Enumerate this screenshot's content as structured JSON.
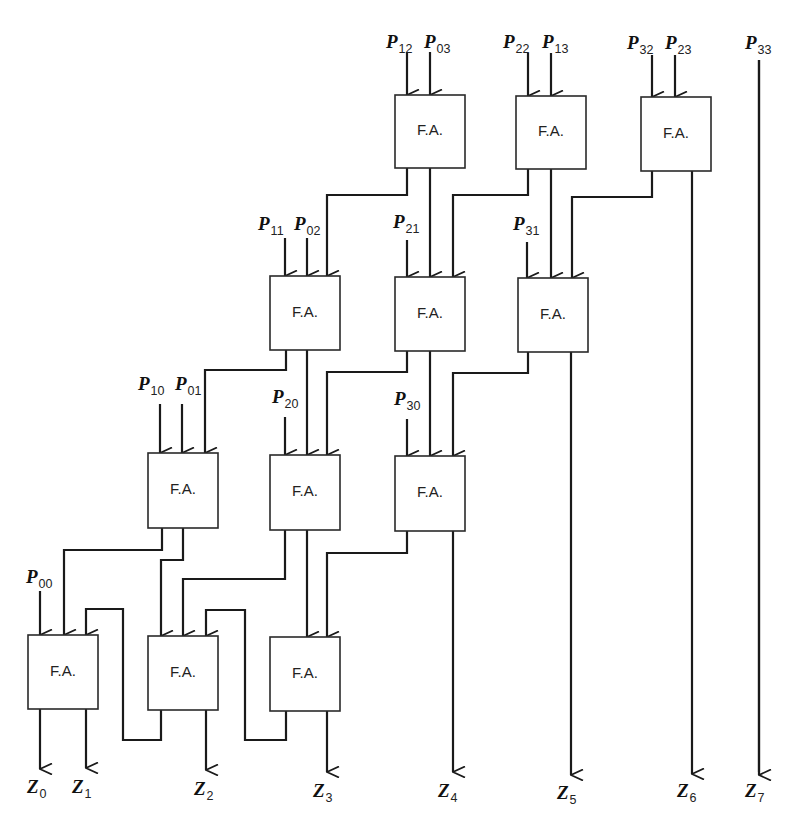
{
  "diagram": {
    "type": "array-multiplier-4x4",
    "cell_label": "F.A.",
    "colors": {
      "line": "#1a1a1a",
      "box_border": "#2a2a2a",
      "background": "#ffffff"
    },
    "cells": [
      {
        "id": "A1",
        "row": 1,
        "x": 395,
        "y": 95,
        "w": 70,
        "h": 73,
        "label": "F.A."
      },
      {
        "id": "A2",
        "row": 1,
        "x": 516,
        "y": 96,
        "w": 70,
        "h": 73,
        "label": "F.A."
      },
      {
        "id": "A3",
        "row": 1,
        "x": 641,
        "y": 97,
        "w": 70,
        "h": 74,
        "label": "F.A."
      },
      {
        "id": "B1",
        "row": 2,
        "x": 270,
        "y": 276,
        "w": 70,
        "h": 74,
        "label": "F.A."
      },
      {
        "id": "B2",
        "row": 2,
        "x": 395,
        "y": 277,
        "w": 70,
        "h": 74,
        "label": "F.A."
      },
      {
        "id": "B3",
        "row": 2,
        "x": 518,
        "y": 278,
        "w": 70,
        "h": 74,
        "label": "F.A."
      },
      {
        "id": "C1",
        "row": 3,
        "x": 148,
        "y": 453,
        "w": 70,
        "h": 75,
        "label": "F.A."
      },
      {
        "id": "C2",
        "row": 3,
        "x": 270,
        "y": 455,
        "w": 70,
        "h": 75,
        "label": "F.A."
      },
      {
        "id": "C3",
        "row": 3,
        "x": 395,
        "y": 456,
        "w": 70,
        "h": 75,
        "label": "F.A."
      },
      {
        "id": "D1",
        "row": 4,
        "x": 28,
        "y": 635,
        "w": 70,
        "h": 74,
        "label": "F.A."
      },
      {
        "id": "D2",
        "row": 4,
        "x": 148,
        "y": 636,
        "w": 70,
        "h": 74,
        "label": "F.A."
      },
      {
        "id": "D3",
        "row": 4,
        "x": 270,
        "y": 637,
        "w": 70,
        "h": 74,
        "label": "F.A."
      }
    ],
    "inputs": [
      {
        "name": "P",
        "sub": "12",
        "label_x": 386,
        "label_y": 48,
        "x": 407,
        "y1": 52,
        "y2": 95
      },
      {
        "name": "P",
        "sub": "03",
        "label_x": 424,
        "label_y": 48,
        "x": 430,
        "y1": 52,
        "y2": 95
      },
      {
        "name": "P",
        "sub": "22",
        "label_x": 503,
        "label_y": 48,
        "x": 528,
        "y1": 53,
        "y2": 96
      },
      {
        "name": "P",
        "sub": "13",
        "label_x": 542,
        "label_y": 48,
        "x": 551,
        "y1": 53,
        "y2": 96
      },
      {
        "name": "P",
        "sub": "32",
        "label_x": 627,
        "label_y": 49,
        "x": 652,
        "y1": 55,
        "y2": 97
      },
      {
        "name": "P",
        "sub": "23",
        "label_x": 665,
        "label_y": 49,
        "x": 675,
        "y1": 55,
        "y2": 97
      },
      {
        "name": "P",
        "sub": "11",
        "label_x": 258,
        "label_y": 230,
        "x": 285,
        "y1": 238,
        "y2": 276
      },
      {
        "name": "P",
        "sub": "02",
        "label_x": 294,
        "label_y": 230,
        "x": 307,
        "y1": 238,
        "y2": 276
      },
      {
        "name": "P",
        "sub": "21",
        "label_x": 393,
        "label_y": 228,
        "x": 407,
        "y1": 240,
        "y2": 277
      },
      {
        "name": "P",
        "sub": "31",
        "label_x": 513,
        "label_y": 230,
        "x": 527,
        "y1": 242,
        "y2": 278
      },
      {
        "name": "P",
        "sub": "10",
        "label_x": 138,
        "label_y": 390,
        "x": 160,
        "y1": 404,
        "y2": 453
      },
      {
        "name": "P",
        "sub": "01",
        "label_x": 175,
        "label_y": 390,
        "x": 182,
        "y1": 404,
        "y2": 453
      },
      {
        "name": "P",
        "sub": "20",
        "label_x": 272,
        "label_y": 403,
        "x": 285,
        "y1": 417,
        "y2": 455
      },
      {
        "name": "P",
        "sub": "30",
        "label_x": 394,
        "label_y": 405,
        "x": 407,
        "y1": 419,
        "y2": 456
      },
      {
        "name": "P",
        "sub": "00",
        "label_x": 26,
        "label_y": 583,
        "x": 40,
        "y1": 591,
        "y2": 635
      },
      {
        "name": "P",
        "sub": "33",
        "label_x": 745,
        "label_y": 49,
        "x": 759,
        "y1": 60,
        "y2": 772
      }
    ],
    "outputs": [
      {
        "name": "Z",
        "sub": "0",
        "label_x": 27,
        "label_y": 793,
        "x": 40,
        "y1": 709,
        "y2": 769
      },
      {
        "name": "Z",
        "sub": "1",
        "label_x": 72,
        "label_y": 793,
        "x": 86,
        "y1": 709,
        "y2": 768
      },
      {
        "name": "Z",
        "sub": "2",
        "label_x": 194,
        "label_y": 795,
        "x": 206,
        "y1": 710,
        "y2": 770
      },
      {
        "name": "Z",
        "sub": "3",
        "label_x": 313,
        "label_y": 797,
        "x": 327,
        "y1": 711,
        "y2": 772
      },
      {
        "name": "Z",
        "sub": "4",
        "label_x": 438,
        "label_y": 797,
        "x": 453,
        "y1": 531,
        "y2": 772
      },
      {
        "name": "Z",
        "sub": "5",
        "label_x": 557,
        "label_y": 799,
        "x": 571,
        "y1": 352,
        "y2": 775
      },
      {
        "name": "Z",
        "sub": "6",
        "label_x": 677,
        "label_y": 797,
        "x": 692,
        "y1": 171,
        "y2": 774
      },
      {
        "name": "Z",
        "sub": "7",
        "label_x": 745,
        "label_y": 797,
        "x": 759,
        "y1": 60,
        "y2": 775
      }
    ],
    "connections": [
      {
        "from": "A1.carry",
        "to": "B1",
        "points": [
          [
            407,
            168
          ],
          [
            407,
            195
          ],
          [
            327,
            195
          ],
          [
            327,
            276
          ]
        ]
      },
      {
        "from": "A1.sum",
        "to": "B2",
        "points": [
          [
            430,
            168
          ],
          [
            430,
            277
          ]
        ]
      },
      {
        "from": "A2.carry",
        "to": "B2",
        "points": [
          [
            528,
            169
          ],
          [
            528,
            195
          ],
          [
            453,
            195
          ],
          [
            453,
            277
          ]
        ]
      },
      {
        "from": "A2.sum",
        "to": "B3",
        "points": [
          [
            551,
            169
          ],
          [
            551,
            278
          ]
        ]
      },
      {
        "from": "A3.carry",
        "to": "B3",
        "points": [
          [
            652,
            171
          ],
          [
            652,
            197
          ],
          [
            572,
            197
          ],
          [
            572,
            278
          ]
        ]
      },
      {
        "from": "B1.carry",
        "to": "C1",
        "points": [
          [
            286,
            350
          ],
          [
            286,
            370
          ],
          [
            205,
            370
          ],
          [
            205,
            453
          ]
        ]
      },
      {
        "from": "B1.sum",
        "to": "C2",
        "points": [
          [
            307,
            350
          ],
          [
            307,
            455
          ]
        ]
      },
      {
        "from": "B2.carry",
        "to": "C2",
        "points": [
          [
            407,
            351
          ],
          [
            407,
            372
          ],
          [
            327,
            372
          ],
          [
            327,
            455
          ]
        ]
      },
      {
        "from": "B2.sum",
        "to": "C3",
        "points": [
          [
            430,
            351
          ],
          [
            430,
            456
          ]
        ]
      },
      {
        "from": "B3.carry",
        "to": "C3",
        "points": [
          [
            528,
            352
          ],
          [
            528,
            373
          ],
          [
            453,
            373
          ],
          [
            453,
            456
          ]
        ]
      },
      {
        "from": "C1.carry",
        "to": "D1",
        "points": [
          [
            162,
            528
          ],
          [
            162,
            550
          ],
          [
            64,
            550
          ],
          [
            64,
            635
          ]
        ]
      },
      {
        "from": "C1.sum",
        "to": "D2",
        "points": [
          [
            183,
            528
          ],
          [
            183,
            560
          ],
          [
            161,
            560
          ],
          [
            161,
            636
          ]
        ]
      },
      {
        "from": "C2.carry",
        "to": "D2",
        "points": [
          [
            285,
            530
          ],
          [
            285,
            579
          ],
          [
            183,
            579
          ],
          [
            183,
            636
          ]
        ]
      },
      {
        "from": "C2.sum",
        "to": "D3",
        "points": [
          [
            307,
            530
          ],
          [
            307,
            637
          ]
        ]
      },
      {
        "from": "C3.carry",
        "to": "D3",
        "points": [
          [
            407,
            531
          ],
          [
            407,
            553
          ],
          [
            327,
            553
          ],
          [
            327,
            637
          ]
        ]
      },
      {
        "from": "D2.carry",
        "to": "D1",
        "points": [
          [
            161,
            710
          ],
          [
            161,
            740
          ],
          [
            123,
            740
          ],
          [
            123,
            609
          ],
          [
            86,
            609
          ],
          [
            86,
            635
          ]
        ]
      },
      {
        "from": "D3.carry",
        "to": "D2",
        "points": [
          [
            286,
            711
          ],
          [
            286,
            740
          ],
          [
            245,
            740
          ],
          [
            245,
            610
          ],
          [
            206,
            610
          ],
          [
            206,
            636
          ]
        ]
      }
    ]
  }
}
